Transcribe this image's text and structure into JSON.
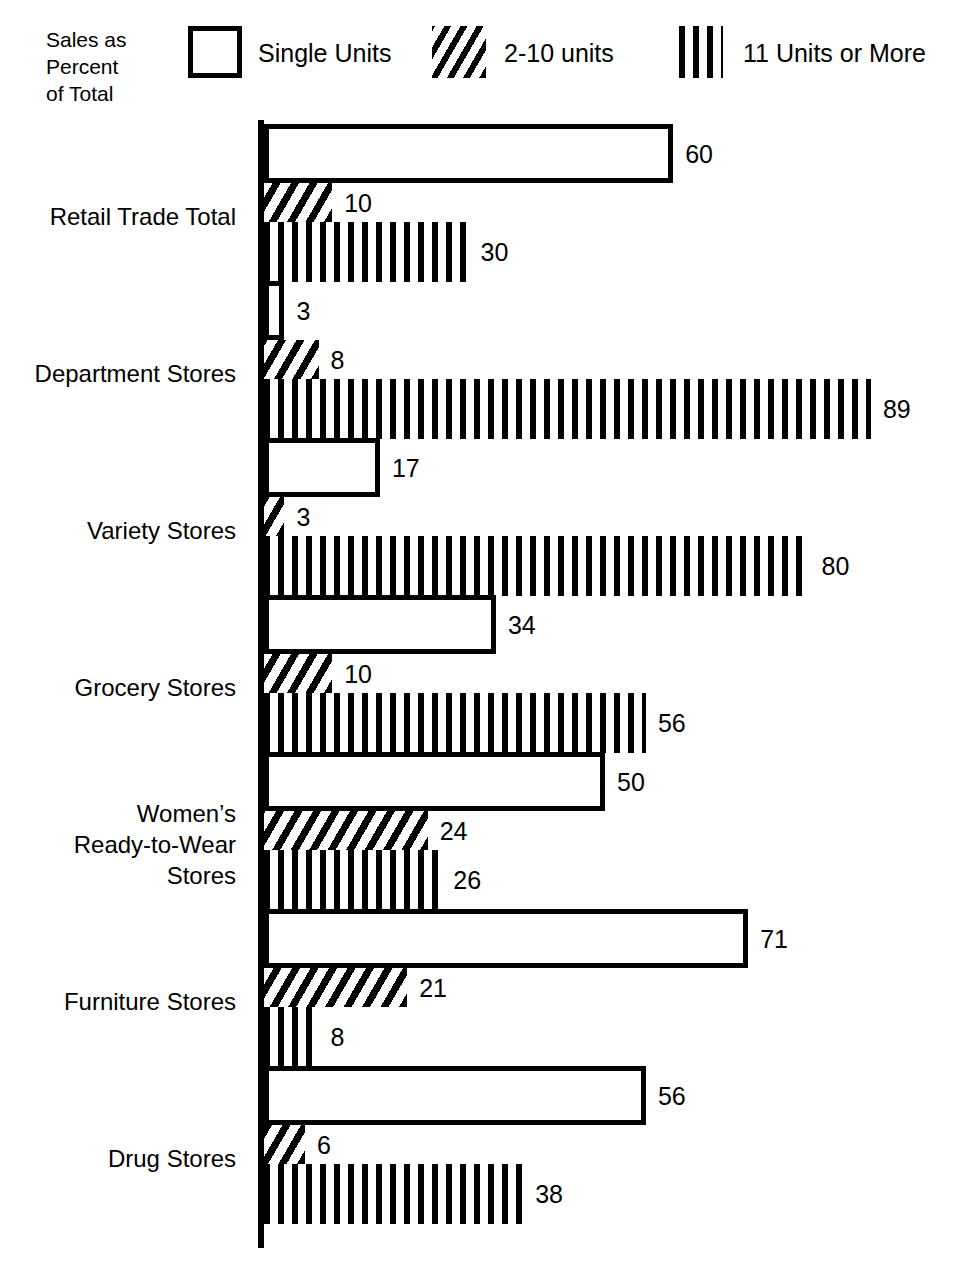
{
  "legend": {
    "caption": "Sales as\nPercent\nof Total",
    "items": [
      {
        "label": "Single Units",
        "pattern": "open-box"
      },
      {
        "label": "2-10 units",
        "pattern": "diagonal-hatch"
      },
      {
        "label": "11 Units or More",
        "pattern": "vertical-lines"
      }
    ]
  },
  "chart_data": {
    "type": "bar",
    "orientation": "horizontal",
    "title": "",
    "subtitle": "",
    "xlabel": "",
    "ylabel": "Sales as Percent of Total",
    "xlim": [
      0,
      100
    ],
    "grid": false,
    "legend_position": "top",
    "categories": [
      "Retail Trade Total",
      "Department Stores",
      "Variety Stores",
      "Grocery Stores",
      "Women’s\nReady-to-Wear\nStores",
      "Furniture Stores",
      "Drug Stores"
    ],
    "series": [
      {
        "name": "Single Units",
        "values": [
          60,
          3,
          17,
          34,
          50,
          71,
          56
        ]
      },
      {
        "name": "2-10 units",
        "values": [
          10,
          8,
          3,
          10,
          24,
          21,
          6
        ]
      },
      {
        "name": "11 Units or More",
        "values": [
          30,
          89,
          80,
          56,
          26,
          8,
          38
        ]
      }
    ],
    "data_labels": [
      [
        "60",
        "10",
        "30"
      ],
      [
        "3",
        "8",
        "89"
      ],
      [
        "17",
        "3",
        "80"
      ],
      [
        "34",
        "10",
        "56"
      ],
      [
        "50",
        "24",
        "26"
      ],
      [
        "71",
        "21",
        "8"
      ],
      [
        "56",
        "6",
        "38"
      ]
    ]
  },
  "colors": {
    "ink": "#000000",
    "paper": "#ffffff"
  }
}
